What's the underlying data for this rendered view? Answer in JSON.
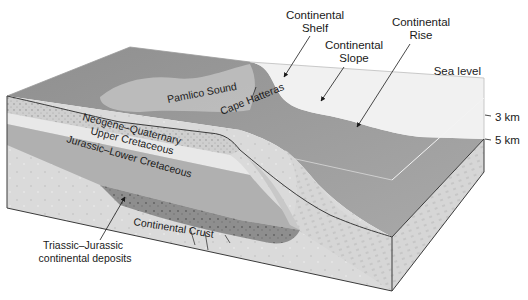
{
  "diagram": {
    "type": "geologic block diagram",
    "callouts": {
      "continental_shelf": {
        "line1": "Continental",
        "line2": "Shelf"
      },
      "continental_slope": {
        "line1": "Continental",
        "line2": "Slope"
      },
      "continental_rise": {
        "line1": "Continental",
        "line2": "Rise"
      },
      "sea_level": "Sea level",
      "pamlico_sound": "Pamlico Sound",
      "cape_hatteras": "Cape Hatteras",
      "continental_crust": "Continental Crust",
      "triassic_jurassic": {
        "line1": "Triassic–Jurassic",
        "line2": "continental deposits"
      }
    },
    "strata": [
      {
        "label": "Neogene–Quaternary"
      },
      {
        "label": "Upper Cretaceous"
      },
      {
        "label": "Jurassic–Lower Cretaceous"
      }
    ],
    "depth_scale": [
      {
        "label": "3 km"
      },
      {
        "label": "5 km"
      }
    ],
    "colors": {
      "land_surface": "#9a9a9a",
      "water": "#a8a8a8",
      "water_column_face": "#e6e6e6",
      "crust_face": "#dcdcdc",
      "deposits": "#8d8d8d",
      "outline": "#3a3a3a"
    }
  }
}
